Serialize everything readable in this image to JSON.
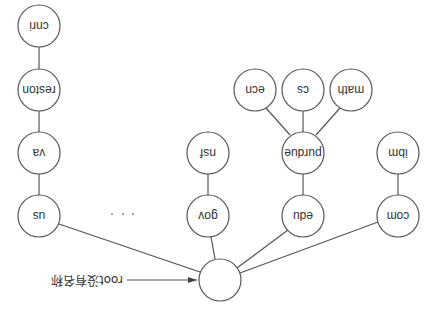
{
  "diagram": {
    "orientation": "rotated-180",
    "root": {
      "label": "",
      "annotation": "root没有名称"
    },
    "ellipsis": "· · ·",
    "nodes": [
      {
        "id": "us",
        "label": "us",
        "parent": "root"
      },
      {
        "id": "va",
        "label": "va",
        "parent": "us"
      },
      {
        "id": "reston",
        "label": "reston",
        "parent": "va"
      },
      {
        "id": "cnri",
        "label": "cnri",
        "parent": "reston"
      },
      {
        "id": "gov",
        "label": "gov",
        "parent": "root"
      },
      {
        "id": "nsf",
        "label": "nsf",
        "parent": "gov"
      },
      {
        "id": "edu",
        "label": "edu",
        "parent": "root"
      },
      {
        "id": "purdue",
        "label": "purdue",
        "parent": "edu"
      },
      {
        "id": "ecn",
        "label": "ecn",
        "parent": "purdue"
      },
      {
        "id": "cs",
        "label": "cs",
        "parent": "purdue"
      },
      {
        "id": "math",
        "label": "math",
        "parent": "purdue"
      },
      {
        "id": "com",
        "label": "com",
        "parent": "root"
      },
      {
        "id": "ibm",
        "label": "ibm",
        "parent": "com"
      }
    ]
  }
}
